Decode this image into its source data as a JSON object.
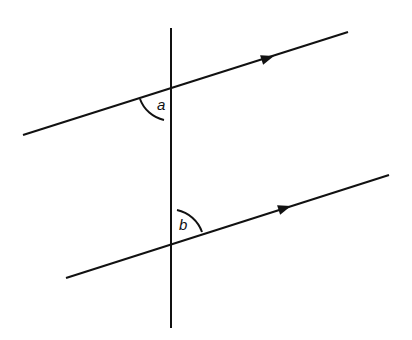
{
  "diagram": {
    "type": "parallel-lines-with-transversal",
    "colors": {
      "background": "#ffffff",
      "stroke": "#111111"
    },
    "transversal": {
      "x1": 171,
      "y1": 28,
      "x2": 171,
      "y2": 328
    },
    "parallel_lines": [
      {
        "name": "upper-parallel-line",
        "x1": 23,
        "y1": 135,
        "x2": 348,
        "y2": 32,
        "arrow": {
          "x": 268,
          "y": 58
        },
        "intersection": {
          "x": 171,
          "y": 88
        }
      },
      {
        "name": "lower-parallel-line",
        "x1": 66,
        "y1": 278,
        "x2": 389,
        "y2": 175,
        "arrow": {
          "x": 285,
          "y": 208
        },
        "intersection": {
          "x": 171,
          "y": 245
        }
      }
    ],
    "angles": [
      {
        "label": "a",
        "position": "below-left of upper intersection",
        "label_x": 157,
        "label_y": 110
      },
      {
        "label": "b",
        "position": "above-right of lower intersection",
        "label_x": 179,
        "label_y": 230
      }
    ]
  }
}
